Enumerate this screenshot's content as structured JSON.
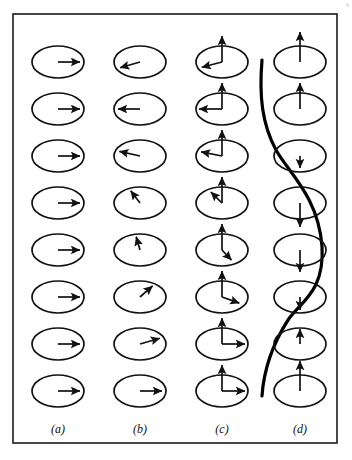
{
  "figure": {
    "corner_mark": "9",
    "frame": {
      "x": 13,
      "y": 14,
      "width": 324,
      "height": 429,
      "stroke": "#1a1a1a",
      "stroke_width": 1.6
    },
    "colors": {
      "ink": "#111111",
      "ellipse": "#111111",
      "arrow": "#111111",
      "curve": "#000000",
      "background": "#ffffff"
    },
    "geometry": {
      "row_count": 8,
      "row_y": [
        62,
        109,
        156,
        203,
        250,
        297,
        344,
        391
      ],
      "column_x": [
        58,
        140,
        222,
        300
      ],
      "ellipse_rx": 26,
      "ellipse_ry": 16
    },
    "columns": [
      {
        "key": "a",
        "label": "(a)",
        "caption_x": 58,
        "caption_y": 433,
        "description": "ferromagnetic ground state - all spins aligned in-plane pointing right",
        "spins": [
          {
            "row": 0,
            "in_plane_angle_deg": 0,
            "in_plane_len": 22,
            "out_of_plane": 0
          },
          {
            "row": 1,
            "in_plane_angle_deg": 0,
            "in_plane_len": 22,
            "out_of_plane": 0
          },
          {
            "row": 2,
            "in_plane_angle_deg": 0,
            "in_plane_len": 22,
            "out_of_plane": 0
          },
          {
            "row": 3,
            "in_plane_angle_deg": 0,
            "in_plane_len": 22,
            "out_of_plane": 0
          },
          {
            "row": 4,
            "in_plane_angle_deg": 0,
            "in_plane_len": 22,
            "out_of_plane": 0
          },
          {
            "row": 5,
            "in_plane_angle_deg": 0,
            "in_plane_len": 22,
            "out_of_plane": 0
          },
          {
            "row": 6,
            "in_plane_angle_deg": 0,
            "in_plane_len": 22,
            "out_of_plane": 0
          },
          {
            "row": 7,
            "in_plane_angle_deg": 0,
            "in_plane_len": 22,
            "out_of_plane": 0
          }
        ]
      },
      {
        "key": "b",
        "label": "(b)",
        "caption_x": 140,
        "caption_y": 433,
        "description": "in-plane spiral / helical spin wave - spin direction rotates by a constant angle from site to site through a full turn",
        "spins": [
          {
            "row": 0,
            "in_plane_angle_deg": 205,
            "in_plane_len": 22,
            "out_of_plane": 0
          },
          {
            "row": 1,
            "in_plane_angle_deg": 180,
            "in_plane_len": 22,
            "out_of_plane": 0
          },
          {
            "row": 2,
            "in_plane_angle_deg": 160,
            "in_plane_len": 22,
            "out_of_plane": 0
          },
          {
            "row": 3,
            "in_plane_angle_deg": 115,
            "in_plane_len": 22,
            "out_of_plane": 0
          },
          {
            "row": 4,
            "in_plane_angle_deg": 100,
            "in_plane_len": 22,
            "out_of_plane": 0
          },
          {
            "row": 5,
            "in_plane_angle_deg": 55,
            "in_plane_len": 22,
            "out_of_plane": 0
          },
          {
            "row": 6,
            "in_plane_angle_deg": 25,
            "in_plane_len": 22,
            "out_of_plane": 0
          },
          {
            "row": 7,
            "in_plane_angle_deg": 0,
            "in_plane_len": 22,
            "out_of_plane": 0
          }
        ]
      },
      {
        "key": "c",
        "label": "(c)",
        "caption_x": 222,
        "caption_y": 433,
        "description": "conical spiral - constant out-of-plane component with rotating in-plane component",
        "spins": [
          {
            "row": 0,
            "in_plane_angle_deg": 203,
            "in_plane_len": 22,
            "out_of_plane": 26
          },
          {
            "row": 1,
            "in_plane_angle_deg": 180,
            "in_plane_len": 23,
            "out_of_plane": 26
          },
          {
            "row": 2,
            "in_plane_angle_deg": 162,
            "in_plane_len": 22,
            "out_of_plane": 26
          },
          {
            "row": 3,
            "in_plane_angle_deg": 122,
            "in_plane_len": 21,
            "out_of_plane": 26
          },
          {
            "row": 4,
            "in_plane_angle_deg": 300,
            "in_plane_len": 19,
            "out_of_plane": 26
          },
          {
            "row": 5,
            "in_plane_angle_deg": 330,
            "in_plane_len": 20,
            "out_of_plane": 26
          },
          {
            "row": 6,
            "in_plane_angle_deg": 0,
            "in_plane_len": 23,
            "out_of_plane": 26
          },
          {
            "row": 7,
            "in_plane_angle_deg": 0,
            "in_plane_len": 23,
            "out_of_plane": 26
          }
        ]
      },
      {
        "key": "d",
        "label": "(d)",
        "caption_x": 300,
        "caption_y": 433,
        "description": "longitudinal spin density wave - moment magnitude and sign modulate along the axis, envelope traced by the heavy curve",
        "spins": [
          {
            "row": 0,
            "in_plane_angle_deg": 0,
            "in_plane_len": 0,
            "out_of_plane": 30
          },
          {
            "row": 1,
            "in_plane_angle_deg": 0,
            "in_plane_len": 0,
            "out_of_plane": 26
          },
          {
            "row": 2,
            "in_plane_angle_deg": 0,
            "in_plane_len": 0,
            "out_of_plane": -12
          },
          {
            "row": 3,
            "in_plane_angle_deg": 0,
            "in_plane_len": 0,
            "out_of_plane": -24
          },
          {
            "row": 4,
            "in_plane_angle_deg": 0,
            "in_plane_len": 0,
            "out_of_plane": -22
          },
          {
            "row": 5,
            "in_plane_angle_deg": 0,
            "in_plane_len": 0,
            "out_of_plane": -13
          },
          {
            "row": 6,
            "in_plane_angle_deg": 0,
            "in_plane_len": 0,
            "out_of_plane": 15
          },
          {
            "row": 7,
            "in_plane_angle_deg": 0,
            "in_plane_len": 0,
            "out_of_plane": 30
          }
        ],
        "envelope_curve": {
          "stroke_width": 3.2,
          "path": "M 262 60 C 259 96, 262 124, 276 150 C 288 172, 318 196, 322 246 C 325 292, 300 302, 288 320 C 274 342, 264 366, 262 396"
        }
      }
    ]
  },
  "chart_data": {
    "type": "diagram",
    "panels": [
      "(a)",
      "(b)",
      "(c)",
      "(d)"
    ],
    "panel_meanings": [
      "uniform in-plane ferromagnetic alignment",
      "in-plane helical spin rotation",
      "conical spiral with fixed out-of-plane tilt",
      "longitudinal spin density wave with amplitude envelope"
    ],
    "sites_per_panel": 8
  }
}
